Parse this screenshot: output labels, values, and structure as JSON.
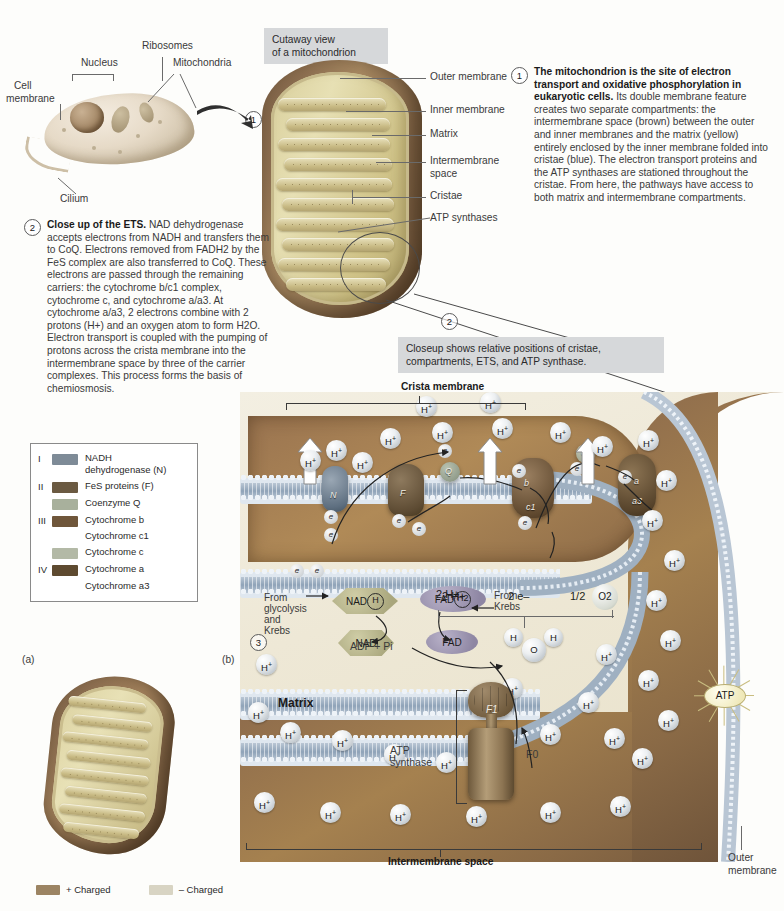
{
  "figure": {
    "panel_a_label": "(a)",
    "panel_b_label": "(b)"
  },
  "cell_diagram": {
    "labels": {
      "cell_membrane": "Cell\nmembrane",
      "cell_membrane_line1": "Cell",
      "cell_membrane_line2": "membrane",
      "nucleus": "Nucleus",
      "ribosomes": "Ribosomes",
      "mitochondria": "Mitochondria",
      "cilium": "Cilium"
    }
  },
  "cutaway": {
    "caption_line1": "Cutaway view",
    "caption_line2": "of a mitochondrion",
    "labels": [
      "Outer membrane",
      "Inner membrane",
      "Matrix",
      "Intermembrane",
      "space",
      "Cristae",
      "ATP synthases"
    ],
    "label_intermembrane_full": "Intermembrane space"
  },
  "callouts": {
    "one": {
      "number": "1",
      "bold": "The mitochondrion is the site of electron transport and oxidative phosphorylation in eukaryotic cells.",
      "rest": " Its double membrane feature creates two separate compartments: the intermembrane space (brown) between the outer and inner membranes and the matrix (yellow) entirely enclosed by the inner membrane folded into cristae (blue). The electron transport proteins and the ATP synthases are stationed throughout the cristae. From here, the pathways have access to both matrix and intermembrane compartments."
    },
    "two": {
      "number": "2",
      "bold": "Close up of the ETS.",
      "rest": " NAD dehydrogenase accepts electrons from NADH and transfers them to CoQ. Electrons removed from FADH2 by the FeS complex are also transferred to CoQ. These electrons are passed through the remaining carriers: the cytochrome b/c1 complex, cytochrome c, and cytochrome a/a3. At cytochrome a/a3, 2 electrons combine with 2 protons (H+) and an oxygen atom to form H2O. Electron transport is coupled with the pumping of protons across the crista membrane into the intermembrane space by three of the carrier complexes. This process forms the basis of chemiosmosis."
    },
    "two_box": {
      "number": "2",
      "caption_line1": "Closeup shows relative positions of cristae,",
      "caption_line2": "compartments, ETS, and ATP synthase."
    },
    "three": {
      "number": "3"
    }
  },
  "legend": {
    "rows": [
      {
        "roman": "I",
        "color": "#7e8b97",
        "label_line1": "NADH",
        "label_line2": "dehydrogenase (N)"
      },
      {
        "roman": "II",
        "color": "#6b5a42",
        "label_line1": "FeS proteins (F)",
        "label_line2": ""
      },
      {
        "roman": "",
        "color": "#a8b09c",
        "label_line1": "Coenzyme Q",
        "label_line2": ""
      },
      {
        "roman": "III",
        "color": "#6f563a",
        "label_line1": "Cytochrome b",
        "label_line2": "Cytochrome c1"
      },
      {
        "roman": "",
        "color": "#b3b9a6",
        "label_line1": "Cytochrome c",
        "label_line2": ""
      },
      {
        "roman": "IV",
        "color": "#5e4a30",
        "label_line1": "Cytochrome a",
        "label_line2": "Cytochrome a3"
      }
    ]
  },
  "charge_legend": {
    "positive_swatch": "#9c8463",
    "positive_label": "+ Charged",
    "negative_swatch": "#d8d4c3",
    "negative_label": "– Charged"
  },
  "closeup": {
    "crista_membrane_label": "Crista membrane",
    "matrix_label": "Matrix",
    "intermembrane_space_label": "Intermembrane space",
    "outer_membrane_label_line1": "Outer",
    "outer_membrane_label_line2": "membrane",
    "atp_synthase_label_line1": "ATP",
    "atp_synthase_label_line2": "synthase",
    "f1_label": "F1",
    "f0_label": "F0",
    "from_glycolysis_lines": [
      "From",
      "glycolysis",
      "and",
      "Krebs"
    ],
    "from_krebs_lines": [
      "From",
      "Krebs"
    ],
    "nadh_label": "NAD",
    "nadh_ring": "H",
    "nad_label": "NAD",
    "fadh2_label": "FAD",
    "fadh2_ring": "H2",
    "fad_label": "FAD",
    "adp_pi_label": "ADP + Pi",
    "atp_label": "ATP",
    "two_protons": "2 H+",
    "two_electrons": "2 e–",
    "half_o2_fraction": "1/2",
    "o2_label": "O2",
    "water_h_left": "H",
    "water_o": "O",
    "water_h_right": "H",
    "complex_letters": {
      "n": "N",
      "f": "F",
      "q": "Q",
      "b": "b",
      "c1": "c1",
      "c": "c",
      "a": "a",
      "a3": "a3"
    },
    "electron_glyph": "e",
    "proton_glyph": "H+"
  }
}
